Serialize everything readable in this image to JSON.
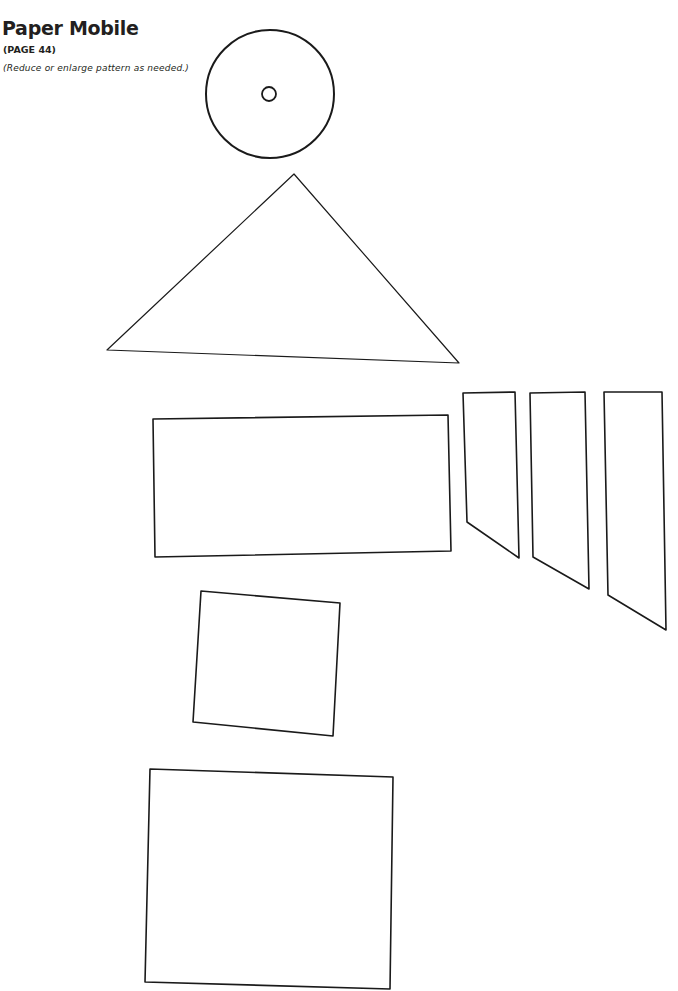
{
  "header": {
    "title": "Paper Mobile",
    "page_ref": "(PAGE 44)",
    "note": "(Reduce or enlarge pattern as needed.)"
  },
  "style": {
    "stroke_color": "#1a1a1a",
    "background": "#ffffff",
    "text_color": "#231f20"
  },
  "pattern": {
    "circle": {
      "cx": 270,
      "cy": 94,
      "r": 64,
      "stroke_width": 2
    },
    "hole": {
      "cx": 269,
      "cy": 94,
      "r": 7,
      "stroke_width": 1.8
    },
    "triangle": {
      "points": "294,174 107,350 459,363",
      "stroke_width": 1.2
    },
    "rectangle_wide": {
      "points": "153,419 448,415 451,551 155,557",
      "stroke_width": 1.6
    },
    "trapezoids": [
      {
        "points": "463,393 515,392 519,558 467,522",
        "stroke_width": 1.6
      },
      {
        "points": "530,393 585,392 589,589 533,557",
        "stroke_width": 1.6
      },
      {
        "points": "604,392 662,392 666,630 608,595",
        "stroke_width": 1.6
      }
    ],
    "square": {
      "points": "201,591 340,603 333,736 193,722",
      "stroke_width": 1.6
    },
    "rectangle_large": {
      "points": "150,769 393,777 390,989 145,982",
      "stroke_width": 1.6
    }
  }
}
